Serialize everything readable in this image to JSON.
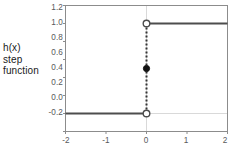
{
  "chart_data": {
    "type": "line",
    "title": "",
    "subtitle": "",
    "xlabel": "",
    "ylabel": "h(x) step function",
    "ylabel_lines": [
      "h(x)",
      "step",
      "function"
    ],
    "xlim": [
      -2,
      2
    ],
    "ylim": [
      -0.2,
      1.2
    ],
    "xticks": [
      -2,
      -1,
      0,
      1,
      2
    ],
    "xtick_labels": [
      "-2",
      "-1",
      "0",
      "1",
      "2"
    ],
    "yticks": [
      -0.2,
      0.0,
      0.2,
      0.4,
      0.6,
      0.8,
      1.0,
      1.2
    ],
    "ytick_labels": [
      "-0.2",
      "0.0",
      "0.2",
      "0.4",
      "0.6",
      "0.8",
      "1.0",
      "1.2"
    ],
    "grid": false,
    "gridlines": {
      "x_at_zero": true,
      "y_at_zero": true
    },
    "legend": null,
    "series": [
      {
        "name": "h(x) step function",
        "type": "step",
        "color": "#4d4d4d",
        "segments": [
          {
            "x": [
              -2,
              0
            ],
            "y": [
              0,
              0
            ]
          },
          {
            "x": [
              0,
              2
            ],
            "y": [
              1,
              1
            ]
          }
        ]
      },
      {
        "name": "discontinuity connector",
        "type": "line",
        "style": "dotted",
        "color": "#333333",
        "x": [
          0,
          0
        ],
        "y": [
          0,
          1
        ]
      }
    ],
    "markers": [
      {
        "name": "open-circle-lower",
        "x": 0,
        "y": 0.0,
        "filled": false,
        "color": "#4d4d4d"
      },
      {
        "name": "open-circle-upper",
        "x": 0,
        "y": 1.0,
        "filled": false,
        "color": "#4d4d4d"
      },
      {
        "name": "filled-dot-midpoint",
        "x": 0,
        "y": 0.5,
        "filled": true,
        "color": "#111111"
      }
    ],
    "colors": {
      "line": "#4d4d4d",
      "connector": "#333333",
      "marker_fill": "#111111",
      "frame": "#8c8c8c",
      "gridline": "#d9d9d9",
      "tick_text": "#58595b",
      "label_text": "#1a1a1a",
      "background": "#ffffff"
    }
  }
}
